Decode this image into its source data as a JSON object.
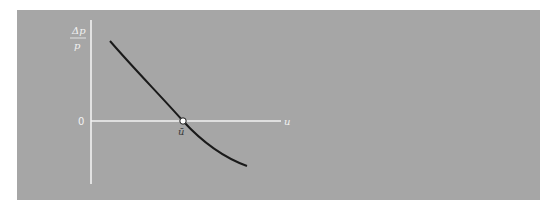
{
  "diagram": {
    "y_axis_label": {
      "numerator": "Δp",
      "denominator": "p"
    },
    "x_axis_label": "u",
    "origin_label": "0",
    "intercept_label": "ū",
    "colors": {
      "background": "#a6a6a6",
      "axes": "#f2f2f2",
      "curve": "#1a1a1a",
      "marker_fill": "#ffffff"
    }
  }
}
